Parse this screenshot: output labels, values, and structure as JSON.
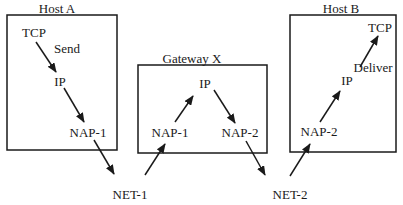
{
  "diagram": {
    "type": "protocol-layer-routing",
    "nodes": {
      "host_a": {
        "title": "Host A",
        "layers": {
          "tcp": "TCP",
          "ip": "IP",
          "nap": "NAP-1"
        },
        "action": "Send"
      },
      "gateway_x": {
        "title": "Gateway X",
        "layers": {
          "ip": "IP",
          "nap_in": "NAP-1",
          "nap_out": "NAP-2"
        }
      },
      "host_b": {
        "title": "Host B",
        "layers": {
          "tcp": "TCP",
          "ip": "IP",
          "nap": "NAP-2"
        },
        "action": "Deliver"
      }
    },
    "networks": {
      "net1": "NET-1",
      "net2": "NET-2"
    },
    "edges": [
      {
        "from": "Host A TCP",
        "to": "Host A IP"
      },
      {
        "from": "Host A IP",
        "to": "Host A NAP-1"
      },
      {
        "from": "Host A NAP-1",
        "to": "NET-1"
      },
      {
        "from": "NET-1",
        "to": "Gateway X NAP-1"
      },
      {
        "from": "Gateway X NAP-1",
        "to": "Gateway X IP"
      },
      {
        "from": "Gateway X IP",
        "to": "Gateway X NAP-2"
      },
      {
        "from": "Gateway X NAP-2",
        "to": "NET-2"
      },
      {
        "from": "NET-2",
        "to": "Host B NAP-2"
      },
      {
        "from": "Host B NAP-2",
        "to": "Host B IP"
      },
      {
        "from": "Host B IP",
        "to": "Host B TCP"
      }
    ],
    "colors": {
      "line": "#1a1a1a",
      "background": "#ffffff"
    }
  }
}
